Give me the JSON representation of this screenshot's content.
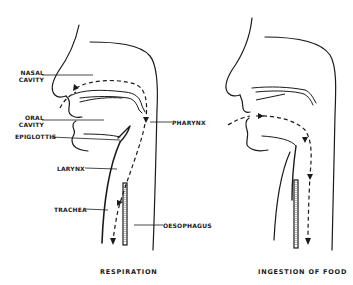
{
  "figure": {
    "panels": [
      {
        "id": "respiration",
        "caption": "RESPIRATION",
        "labels": {
          "nasal_cavity_1": "NASAL",
          "nasal_cavity_2": "CAVITY",
          "oral_cavity_1": "ORAL",
          "oral_cavity_2": "CAVITY",
          "epiglottis": "EPIGLOTTIS",
          "larynx": "LARYNX",
          "trachea": "TRACHEA",
          "pharynx": "PHARYNX",
          "oesophagus": "OESOPHAGUS"
        },
        "pathway": "air: nose -> nasal cavity -> pharynx -> larynx -> trachea"
      },
      {
        "id": "ingestion",
        "caption": "INGESTION  OF  FOOD",
        "pathway": "food: mouth -> pharynx -> oesophagus"
      }
    ],
    "colors": {
      "ink": "#1a1a1a",
      "background": "#ffffff"
    }
  }
}
